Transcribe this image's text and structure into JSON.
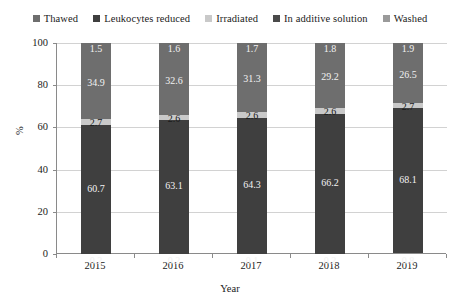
{
  "chart_data": {
    "type": "bar",
    "subtype": "stacked-100-percent",
    "title": "",
    "xlabel": "Year",
    "ylabel": "%",
    "categories": [
      "2015",
      "2016",
      "2017",
      "2018",
      "2019"
    ],
    "ylim": [
      0,
      100
    ],
    "yticks": [
      0,
      20,
      40,
      60,
      80,
      100
    ],
    "ytick_labels": [
      "0",
      "20",
      "40",
      "60",
      "80",
      "100"
    ],
    "grid": true,
    "legend_position": "top",
    "series": [
      {
        "name": "Thawed",
        "color": "#3f3f3f",
        "values": [
          0.2,
          0.2,
          0.1,
          0.2,
          0.8
        ],
        "labels": [
          "0.2",
          "0.2",
          "0.1",
          "0.2",
          "0.8"
        ]
      },
      {
        "name": "Leukocytes reduced",
        "color": "#3f3f3f",
        "values": [
          60.7,
          63.1,
          64.3,
          66.2,
          68.1
        ],
        "labels": [
          "60.7",
          "63.1",
          "64.3",
          "66.2",
          "68.1"
        ]
      },
      {
        "name": "Irradiated",
        "color": "#c9c9c9",
        "values": [
          2.7,
          2.6,
          2.6,
          2.6,
          2.7
        ],
        "labels": [
          "2.7",
          "2.6",
          "2.6",
          "2.6",
          "2.7"
        ]
      },
      {
        "name": "In additive solution",
        "color": "#6e6e6e",
        "values": [
          34.9,
          32.6,
          31.3,
          29.2,
          26.5
        ],
        "labels": [
          "34.9",
          "32.6",
          "31.3",
          "29.2",
          "26.5"
        ]
      },
      {
        "name": "Washed",
        "color": "#6e6e6e",
        "values": [
          1.5,
          1.6,
          1.7,
          1.8,
          1.9
        ],
        "labels": [
          "1.5",
          "1.6",
          "1.7",
          "1.8",
          "1.9"
        ]
      }
    ]
  },
  "legend": {
    "items": [
      {
        "label": "Thawed",
        "color": "#6e6e6e"
      },
      {
        "label": "Leukocytes reduced",
        "color": "#3f3f3f"
      },
      {
        "label": "Irradiated",
        "color": "#c9c9c9"
      },
      {
        "label": "In additive solution",
        "color": "#4a4a4a"
      },
      {
        "label": "Washed",
        "color": "#9a9a9a"
      }
    ]
  }
}
